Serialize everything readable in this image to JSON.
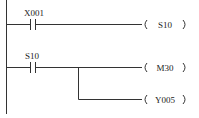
{
  "diagram": {
    "type": "ladder",
    "rungs": [
      {
        "contacts": [
          {
            "label": "X001",
            "kind": "normally-open"
          }
        ],
        "coils": [
          {
            "label": "S10"
          }
        ]
      },
      {
        "contacts": [
          {
            "label": "S10",
            "kind": "normally-open"
          }
        ],
        "coils": [
          {
            "label": "M30"
          },
          {
            "label": "Y005"
          }
        ]
      }
    ]
  }
}
